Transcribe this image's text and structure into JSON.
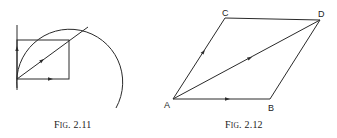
{
  "figures": [
    {
      "id": "fig-2-11",
      "caption_prefix": "F",
      "caption_smallcaps": "IG",
      "caption_number": ". 2.11",
      "elements": [
        "vertical-vector",
        "rectangle",
        "diagonal-resultant",
        "circular-arc",
        "horizontal-vector"
      ]
    },
    {
      "id": "fig-2-12",
      "caption_prefix": "F",
      "caption_smallcaps": "IG",
      "caption_number": ". 2.12",
      "points": {
        "A": "A",
        "B": "B",
        "C": "C",
        "D": "D"
      },
      "edges": [
        "AB",
        "AC",
        "CD",
        "BD",
        "AD"
      ]
    }
  ],
  "colors": {
    "ink": "#2a2a2a",
    "background": "#ffffff"
  }
}
